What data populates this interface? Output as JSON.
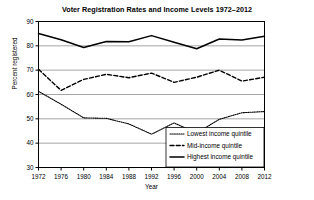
{
  "chart_data": {
    "type": "line",
    "title": "Voter Registration Rates and Income Levels 1972–2012",
    "xlabel": "Year",
    "ylabel": "Percent registered",
    "x": [
      1972,
      1976,
      1980,
      1984,
      1988,
      1992,
      1996,
      2000,
      2004,
      2008,
      2012
    ],
    "xtick_labels": [
      "1972",
      "1976",
      "1980",
      "1984",
      "1988",
      "1992",
      "1996",
      "2000",
      "2004",
      "2008",
      "2012"
    ],
    "ytick_labels": [
      "30",
      "40",
      "50",
      "60",
      "70",
      "80",
      "90"
    ],
    "yticks": [
      30,
      40,
      50,
      60,
      70,
      80,
      90
    ],
    "xlim": [
      1972,
      2012
    ],
    "ylim": [
      30,
      90
    ],
    "grid": true,
    "grid_axis": "y",
    "legend_position": "lower right",
    "series": [
      {
        "name": "Lowest income quintile",
        "style": "dotted",
        "color": "#000000",
        "values": [
          61.3,
          56.0,
          50.4,
          50.2,
          47.9,
          43.7,
          48.3,
          44.2,
          49.8,
          52.5,
          53.0
        ]
      },
      {
        "name": "Mid-income quintile",
        "style": "dashed",
        "color": "#000000",
        "values": [
          70.4,
          61.7,
          66.2,
          68.3,
          66.9,
          68.8,
          65.0,
          67.1,
          70.0,
          65.5,
          67.1
        ]
      },
      {
        "name": "Highest income quintile",
        "style": "solid",
        "color": "#000000",
        "values": [
          85.1,
          82.5,
          79.3,
          81.8,
          81.7,
          84.2,
          81.5,
          78.8,
          82.8,
          82.4,
          83.9
        ]
      }
    ]
  },
  "legend": {
    "entries": [
      {
        "label": "Lowest income quintile",
        "style": "dotted"
      },
      {
        "label": "Mid-income quintile",
        "style": "dashed"
      },
      {
        "label": "Highest income quintile",
        "style": "solid"
      }
    ]
  }
}
